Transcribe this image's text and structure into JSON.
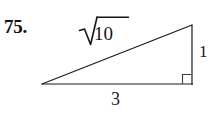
{
  "figure": {
    "problem_number": "75.",
    "shape": "right-triangle",
    "background_color": "#ffffff",
    "stroke_color": "#1a1a1a",
    "text_color": "#141414",
    "canvas": {
      "width": 220,
      "height": 117
    },
    "vertices": {
      "left_apex": {
        "x": 42,
        "y": 84
      },
      "top_right": {
        "x": 192,
        "y": 25
      },
      "bottom_right": {
        "x": 192,
        "y": 84
      }
    },
    "right_angle_marker": {
      "at_vertex": "bottom_right",
      "size": 9,
      "symbol_name": "right-angle-square"
    },
    "labels": {
      "hypotenuse": {
        "text": "√10",
        "radical_symbol": "√",
        "radicand": "10",
        "has_vinculum": true
      },
      "vertical_leg": "1",
      "base_leg": "3"
    }
  }
}
